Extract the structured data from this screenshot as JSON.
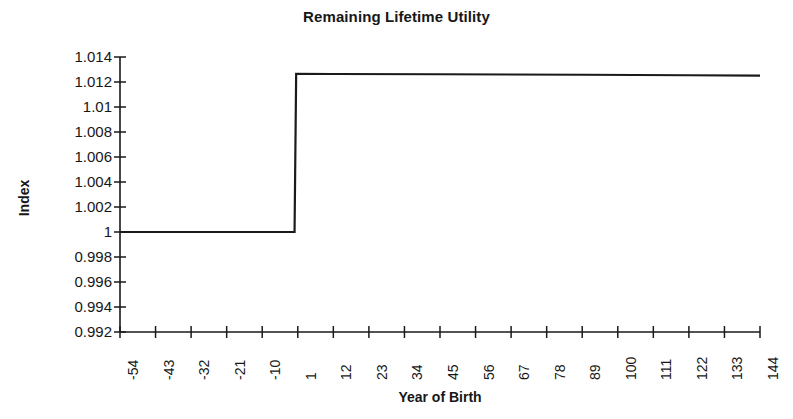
{
  "chart_data": {
    "type": "line",
    "title": "Remaining Lifetime Utility",
    "xlabel": "Year of Birth",
    "ylabel": "Index",
    "grid": false,
    "legend": null,
    "xlim": [
      -54,
      144
    ],
    "ylim": [
      0.992,
      1.014
    ],
    "x_tick_labels": [
      "-54",
      "-43",
      "-32",
      "-21",
      "-10",
      "1",
      "12",
      "23",
      "34",
      "45",
      "56",
      "67",
      "78",
      "89",
      "100",
      "111",
      "122",
      "133",
      "144"
    ],
    "x_tick_values": [
      -54,
      -43,
      -32,
      -21,
      -10,
      1,
      12,
      23,
      34,
      45,
      56,
      67,
      78,
      89,
      100,
      111,
      122,
      133,
      144
    ],
    "y_tick_labels": [
      "1.014",
      "1.012",
      "1.01",
      "1.008",
      "1.006",
      "1.004",
      "1.002",
      "1",
      "0.998",
      "0.996",
      "0.994",
      "0.992"
    ],
    "y_tick_values": [
      1.014,
      1.012,
      1.01,
      1.008,
      1.006,
      1.004,
      1.002,
      1,
      0.998,
      0.996,
      0.994,
      0.992
    ],
    "series": [
      {
        "name": "Remaining Lifetime Utility",
        "color": "#1a1a1a",
        "x": [
          -54,
          -10,
          0,
          0.5,
          12,
          45,
          89,
          122,
          144
        ],
        "values": [
          1.0,
          1.0,
          1.0,
          1.01265,
          1.01264,
          1.01262,
          1.01258,
          1.01254,
          1.01251
        ]
      }
    ],
    "annotations": [
      "Step increase occurs at year of birth 1 (cohorts born after reform)",
      "Pre-reform cohorts remain at index 1",
      "Post-reform index approximately 1.0126, declining marginally toward 1.0125"
    ]
  },
  "axis": {
    "line_color": "#1a1a1a"
  }
}
